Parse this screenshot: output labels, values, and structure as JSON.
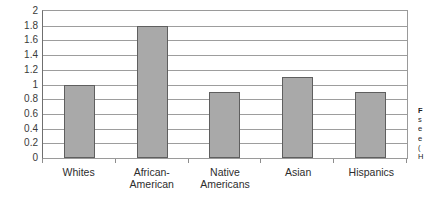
{
  "chart_data": {
    "type": "bar",
    "title": "",
    "xlabel": "",
    "ylabel": "",
    "categories": [
      "Whites",
      "African-American",
      "Native Americans",
      "Asian",
      "Hispanics"
    ],
    "category_lines": [
      [
        "Whites"
      ],
      [
        "African-American"
      ],
      [
        "Native",
        "Americans"
      ],
      [
        "Asian"
      ],
      [
        "Hispanics"
      ]
    ],
    "values": [
      1.0,
      1.8,
      0.9,
      1.1,
      0.9
    ],
    "ylim": [
      0,
      2
    ],
    "ytick_step": 0.2,
    "ytick_labels": [
      "2",
      "1.8",
      "1.6",
      "1.4",
      "1.2",
      "1",
      "0.8",
      "0.6",
      "0.4",
      "0.2",
      "0"
    ],
    "grid": true,
    "legend": "none",
    "bar_color": "#a9a9a9",
    "bar_border_color": "#5f5f5f",
    "gridline_color": "#9d9d9d",
    "axis_color": "#6f6f6f"
  },
  "caption": {
    "title": "F",
    "lines": [
      "s",
      "e",
      "e",
      "(",
      "H"
    ]
  }
}
